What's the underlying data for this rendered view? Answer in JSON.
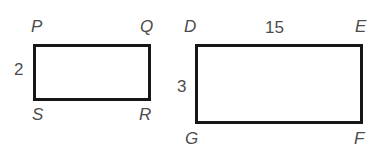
{
  "figure": {
    "background_color": "#ffffff",
    "stroke_color": "#161616",
    "label_color": "#4c4c4c"
  },
  "shapes": [
    {
      "name": "rectangle-pqrs",
      "vertices": [
        "P",
        "Q",
        "R",
        "S"
      ],
      "labeled_side_length": "2",
      "labeled_side": "left"
    },
    {
      "name": "rectangle-defg",
      "vertices": [
        "D",
        "E",
        "F",
        "G"
      ],
      "labeled_side_lengths": {
        "top": "15",
        "left": "3"
      }
    }
  ],
  "left_rect": {
    "vertex_p": "P",
    "vertex_q": "Q",
    "vertex_r": "R",
    "vertex_s": "S",
    "height_label": "2"
  },
  "right_rect": {
    "vertex_d": "D",
    "vertex_e": "E",
    "vertex_f": "F",
    "vertex_g": "G",
    "width_label": "15",
    "height_label": "3"
  }
}
